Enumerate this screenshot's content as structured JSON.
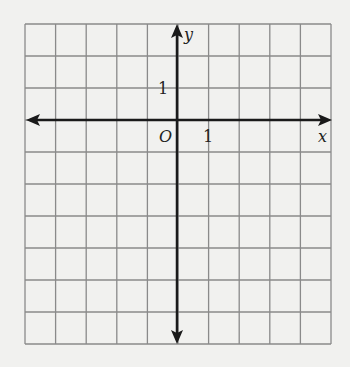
{
  "grid": {
    "columns": 10,
    "rows": 10,
    "left": 25,
    "top": 24,
    "cell_w": 30.6,
    "cell_h": 32,
    "line_color": "#8a8a8a"
  },
  "axes": {
    "origin_col": 5,
    "origin_row": 3,
    "x_label": "x",
    "y_label": "y",
    "origin_label": "O",
    "x_tick_label": "1",
    "y_tick_label": "1",
    "color": "#1a1a1a"
  }
}
